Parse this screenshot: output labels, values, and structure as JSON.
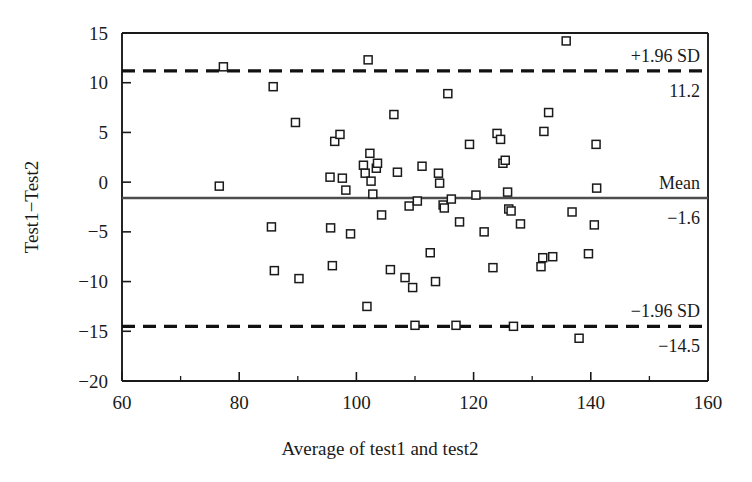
{
  "chart_data": {
    "type": "scatter",
    "title": "",
    "xlabel": "Average of test1 and test2",
    "ylabel": "Test1−Test2",
    "xlim": [
      60,
      160
    ],
    "ylim": [
      -20,
      15
    ],
    "xticks": [
      60,
      80,
      100,
      120,
      140,
      160
    ],
    "xtick_labels": [
      "60",
      "80",
      "100",
      "120",
      "140",
      "160"
    ],
    "xticks_minor": [
      70,
      90,
      110,
      130,
      150
    ],
    "yticks": [
      15,
      10,
      5,
      0,
      -5,
      -10,
      -15,
      -20
    ],
    "ytick_labels": [
      "15",
      "10",
      "5",
      "0",
      "−5",
      "−10",
      "−15",
      "−20"
    ],
    "grid": false,
    "legend": "none",
    "reference_lines": [
      {
        "name": "upper-limit-of-agreement",
        "label": "+1.96 SD",
        "value_label": "11.2",
        "y": 11.2,
        "style": "dashed",
        "color": "#111111"
      },
      {
        "name": "mean-difference",
        "label": "Mean",
        "value_label": "−1.6",
        "y": -1.6,
        "style": "solid",
        "color": "#4d4d4d"
      },
      {
        "name": "lower-limit-of-agreement",
        "label": "−1.96 SD",
        "value_label": "−14.5",
        "y": -14.5,
        "style": "dashed",
        "color": "#111111"
      }
    ],
    "marker": {
      "shape": "square",
      "fill": "#ffffff",
      "edge": "#1a1a1a",
      "size": 8
    },
    "points": [
      {
        "x": 76.6,
        "y": -0.4
      },
      {
        "x": 77.3,
        "y": 11.6
      },
      {
        "x": 85.5,
        "y": -4.5
      },
      {
        "x": 85.8,
        "y": 9.6
      },
      {
        "x": 86.0,
        "y": -8.9
      },
      {
        "x": 89.6,
        "y": 6.0
      },
      {
        "x": 90.2,
        "y": -9.7
      },
      {
        "x": 95.5,
        "y": 0.5
      },
      {
        "x": 95.6,
        "y": -4.6
      },
      {
        "x": 95.9,
        "y": -8.4
      },
      {
        "x": 96.3,
        "y": 4.1
      },
      {
        "x": 97.2,
        "y": 4.8
      },
      {
        "x": 97.6,
        "y": 0.4
      },
      {
        "x": 98.2,
        "y": -0.8
      },
      {
        "x": 99.0,
        "y": -5.2
      },
      {
        "x": 101.2,
        "y": 1.7
      },
      {
        "x": 101.5,
        "y": 0.9
      },
      {
        "x": 101.8,
        "y": -12.5
      },
      {
        "x": 102.0,
        "y": 12.3
      },
      {
        "x": 102.3,
        "y": 2.9
      },
      {
        "x": 102.5,
        "y": 0.1
      },
      {
        "x": 102.8,
        "y": -1.2
      },
      {
        "x": 103.4,
        "y": 1.4
      },
      {
        "x": 103.6,
        "y": 1.9
      },
      {
        "x": 104.3,
        "y": -3.3
      },
      {
        "x": 105.8,
        "y": -8.8
      },
      {
        "x": 106.4,
        "y": 6.8
      },
      {
        "x": 107.0,
        "y": 1.0
      },
      {
        "x": 108.3,
        "y": -9.6
      },
      {
        "x": 109.0,
        "y": -2.4
      },
      {
        "x": 109.6,
        "y": -10.6
      },
      {
        "x": 110.0,
        "y": -14.4
      },
      {
        "x": 110.4,
        "y": -1.9
      },
      {
        "x": 111.2,
        "y": 1.6
      },
      {
        "x": 112.6,
        "y": -7.1
      },
      {
        "x": 113.5,
        "y": -10.0
      },
      {
        "x": 114.0,
        "y": 0.9
      },
      {
        "x": 114.2,
        "y": -0.1
      },
      {
        "x": 114.8,
        "y": -2.3
      },
      {
        "x": 115.0,
        "y": -2.6
      },
      {
        "x": 115.6,
        "y": 8.9
      },
      {
        "x": 116.2,
        "y": -1.7
      },
      {
        "x": 117.0,
        "y": -14.4
      },
      {
        "x": 117.6,
        "y": -4.0
      },
      {
        "x": 119.3,
        "y": 3.8
      },
      {
        "x": 120.4,
        "y": -1.3
      },
      {
        "x": 121.8,
        "y": -5.0
      },
      {
        "x": 123.3,
        "y": -8.6
      },
      {
        "x": 124.0,
        "y": 4.9
      },
      {
        "x": 124.6,
        "y": 4.3
      },
      {
        "x": 125.0,
        "y": 1.9
      },
      {
        "x": 125.4,
        "y": 2.2
      },
      {
        "x": 125.8,
        "y": -1.0
      },
      {
        "x": 126.0,
        "y": -2.7
      },
      {
        "x": 126.4,
        "y": -2.9
      },
      {
        "x": 126.8,
        "y": -14.5
      },
      {
        "x": 128.0,
        "y": -4.2
      },
      {
        "x": 131.5,
        "y": -8.5
      },
      {
        "x": 131.8,
        "y": -7.6
      },
      {
        "x": 132.0,
        "y": 5.1
      },
      {
        "x": 132.8,
        "y": 7.0
      },
      {
        "x": 133.5,
        "y": -7.5
      },
      {
        "x": 135.8,
        "y": 14.2
      },
      {
        "x": 136.8,
        "y": -3.0
      },
      {
        "x": 138.0,
        "y": -15.7
      },
      {
        "x": 139.6,
        "y": -7.2
      },
      {
        "x": 140.6,
        "y": -4.3
      },
      {
        "x": 140.9,
        "y": 3.8
      },
      {
        "x": 141.0,
        "y": -0.6
      }
    ]
  }
}
